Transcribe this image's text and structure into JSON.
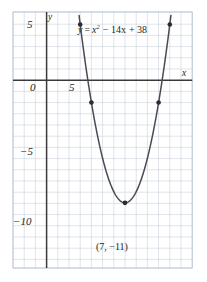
{
  "figure": {
    "equation_label": "y = x2 − 14x + 38",
    "equation_parts": {
      "lhs": "y",
      "eq": "=",
      "var": "x",
      "exponent": "2",
      "linear_term": "− 14x",
      "constant": "+ 38"
    },
    "vertex_label": "(7, −11)",
    "axis_labels": {
      "x": "x",
      "y": "y"
    },
    "tick_labels": {
      "y": [
        "5",
        "0",
        "−5",
        "−10"
      ],
      "x": [
        "5"
      ]
    },
    "colors": {
      "grid": "#c8d2dd",
      "frame": "#b9c4d0",
      "axis": "#3a3a3a",
      "curve": "#4a4a52",
      "point": "#2b2b33",
      "text": "#231f20",
      "background": "#ffffff"
    }
  },
  "chart_data": {
    "type": "line",
    "title": "",
    "subtitle": "",
    "xlabel": "x",
    "ylabel": "y",
    "equation": "y = x^2 - 14x + 38",
    "function": {
      "a": 1,
      "b": -14,
      "c": 38
    },
    "vertex": {
      "x": 7,
      "y": -11,
      "label": "(7, −11)"
    },
    "xlim": [
      -3,
      13.1
    ],
    "ylim": [
      -12.7,
      10.3
    ],
    "xticks": [
      0,
      5
    ],
    "xtick_labels": [
      "0",
      "5"
    ],
    "yticks": [
      5,
      0,
      -5,
      -10
    ],
    "ytick_labels": [
      "5",
      "0",
      "−5",
      "−10"
    ],
    "grid": true,
    "grid_step": 1,
    "legend": "none",
    "marked_points": [
      {
        "x": 3,
        "y": 5
      },
      {
        "x": 11,
        "y": 5
      },
      {
        "x": 4,
        "y": -2
      },
      {
        "x": 10,
        "y": -2
      },
      {
        "x": 7,
        "y": -11
      }
    ],
    "annotations": [
      {
        "text": "y = x^2 - 14x + 38",
        "x": 4.2,
        "y": 8.2
      },
      {
        "text": "(7, −11)",
        "x": 7,
        "y": -12.2
      }
    ],
    "series": [
      {
        "name": "y = x^2 - 14x + 38",
        "x": [
          2.3,
          2.6,
          2.9,
          3.2,
          3.5,
          3.8,
          4.1,
          4.4,
          4.7,
          5.0,
          5.3,
          5.6,
          5.9,
          6.2,
          6.5,
          6.8,
          7.1,
          7.4,
          7.7,
          8.0,
          8.3,
          8.6,
          8.9,
          9.2,
          9.5,
          9.8,
          10.1,
          10.4,
          10.7,
          11.0,
          11.3,
          11.6,
          11.9
        ],
        "y": [
          11.0,
          8.2,
          5.6,
          3.2,
          1.0,
          -1.0,
          -2.8,
          -4.4,
          -5.8,
          -7.0,
          -8.0,
          -8.8,
          -9.4,
          -9.8,
          -10.0,
          -10.0,
          -9.8,
          -9.4,
          -8.8,
          -8.0,
          -7.0,
          -5.8,
          -4.4,
          -2.8,
          -1.0,
          1.0,
          3.2,
          5.6,
          8.2,
          11.0,
          14.0,
          17.2,
          20.6
        ]
      }
    ]
  }
}
